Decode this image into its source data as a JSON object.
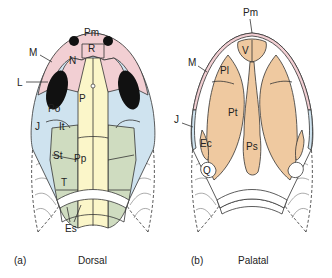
{
  "colors": {
    "pink": "#f2cfd3",
    "blue": "#cfe3ef",
    "yellow": "#fbf6c9",
    "green": "#cfdcc0",
    "tan": "#efc9a0",
    "orbit": "#111111",
    "outline": "#333333"
  },
  "panel_a": {
    "caption_letter": "(a)",
    "caption_title": "Dorsal",
    "labels": {
      "Pm": "Pm",
      "R": "R",
      "M": "M",
      "N": "N",
      "L": "L",
      "P": "P",
      "Po": "Po",
      "J": "J",
      "It": "It",
      "St": "St",
      "Pp": "Pp",
      "T": "T",
      "Es": "Es"
    }
  },
  "panel_b": {
    "caption_letter": "(b)",
    "caption_title": "Palatal",
    "labels": {
      "Pm": "Pm",
      "V": "V",
      "M": "M",
      "Pl": "Pl",
      "Pt": "Pt",
      "J": "J",
      "Ec": "Ec",
      "Ps": "Ps",
      "Q": "Q"
    }
  }
}
